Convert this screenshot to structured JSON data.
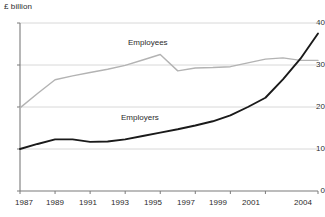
{
  "chart_data": {
    "type": "line",
    "title": "",
    "ylabel": "£ billion",
    "xlabel": "",
    "ylim": [
      0,
      40
    ],
    "yticks": [
      0,
      10,
      20,
      30,
      40
    ],
    "ytick_labels": [
      "0",
      "10",
      "20",
      "30",
      "40"
    ],
    "xlim": [
      1987,
      2004
    ],
    "xticks": [
      1987,
      1989,
      1991,
      1993,
      1995,
      1997,
      1999,
      2001,
      2004
    ],
    "xtick_labels": [
      "1987",
      "1989",
      "1991",
      "1993",
      "1995",
      "1997",
      "1999",
      "2001",
      "2004"
    ],
    "grid": "horizontal",
    "legend_position": "inline-annotations",
    "x": [
      1987,
      1988,
      1989,
      1990,
      1991,
      1992,
      1993,
      1994,
      1995,
      1996,
      1997,
      1998,
      1999,
      2000,
      2001,
      2002,
      2003,
      2004
    ],
    "series": [
      {
        "name": "Employees",
        "color": "#b3b3b3",
        "values": [
          19.8,
          23.2,
          26.5,
          27.4,
          28.2,
          29.0,
          29.9,
          31.2,
          32.5,
          28.6,
          29.3,
          29.4,
          29.6,
          30.5,
          31.4,
          31.7,
          31.1,
          31.1
        ]
      },
      {
        "name": "Employers",
        "color": "#1a1a1a",
        "values": [
          10.0,
          11.2,
          12.3,
          12.3,
          11.7,
          11.8,
          12.3,
          13.1,
          13.9,
          14.7,
          15.6,
          16.6,
          18.0,
          20.0,
          22.2,
          26.6,
          31.5,
          37.5
        ]
      }
    ],
    "annotations": [
      {
        "text": "Employees",
        "x": 1994,
        "y": 36.0
      },
      {
        "text": "Employers",
        "x": 1995.5,
        "y": 17.0
      }
    ]
  },
  "axis_unit": "£ billion",
  "colors": {
    "employees_line": "#b3b3b3",
    "employers_line": "#1a1a1a",
    "gridline": "#d8d8d8",
    "axis": "#7a7a7a",
    "text": "#2b2b2b",
    "background": "#ffffff"
  }
}
